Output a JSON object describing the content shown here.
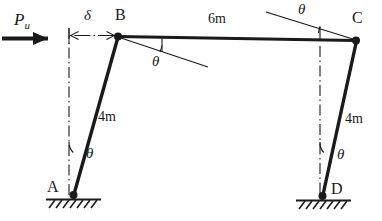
{
  "figure": {
    "type": "structural-frame-sway-mechanism"
  },
  "load": {
    "label": "P",
    "subscript": "u",
    "direction": "right"
  },
  "displacement": {
    "label": "δ"
  },
  "nodes": {
    "a": "A",
    "b": "B",
    "c": "C",
    "d": "D"
  },
  "members": {
    "beam_bc_length": "6m",
    "column_ab_length": "4m",
    "column_dc_length": "4m"
  },
  "angles": {
    "b_rotation": "θ",
    "c_rotation": "θ",
    "ab_tilt": "θ",
    "dc_tilt": "θ"
  },
  "supports": {
    "a_type": "pin-support-hatched",
    "d_type": "pin-support-hatched"
  },
  "colors": {
    "ink": "#1a1a1a",
    "background": "#ffffff"
  },
  "geometry": {
    "point_a": [
      73,
      197
    ],
    "point_b": [
      118,
      36
    ],
    "point_c": [
      356,
      40
    ],
    "point_d": [
      322,
      198
    ]
  }
}
